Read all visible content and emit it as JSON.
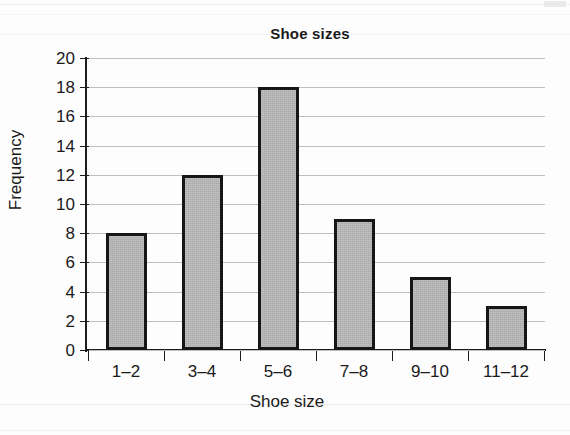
{
  "chart_data": {
    "type": "bar",
    "title": "Shoe sizes",
    "xlabel": "Shoe size",
    "ylabel": "Frequency",
    "categories": [
      "1–2",
      "3–4",
      "5–6",
      "7–8",
      "9–10",
      "11–12"
    ],
    "values": [
      8,
      12,
      18,
      9,
      5,
      3
    ],
    "ylim": [
      0,
      20
    ],
    "ytick_labels": [
      "0",
      "2",
      "4",
      "6",
      "8",
      "10",
      "12",
      "14",
      "16",
      "18",
      "20"
    ],
    "ytick_values": [
      0,
      2,
      4,
      6,
      8,
      10,
      12,
      14,
      16,
      18,
      20
    ],
    "ytick_step": 2,
    "grid": "horizontal",
    "legend": "none",
    "bar_fill_color": "#a9a9a9",
    "bar_edge_color": "#161616",
    "gridline_color": "#bfbfbf",
    "axis_color": "#1c1c1c",
    "background_color": "#fdfdfd"
  }
}
